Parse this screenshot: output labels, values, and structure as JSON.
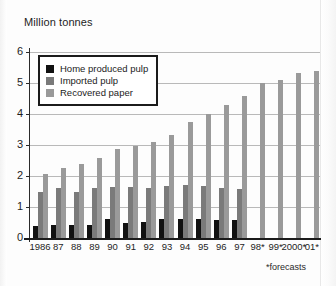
{
  "chart_data": {
    "type": "bar",
    "title": "Million tonnes",
    "xlabel": "",
    "ylabel": "Million tonnes",
    "ylim": [
      0,
      6
    ],
    "yticks": [
      0,
      1,
      2,
      3,
      4,
      5,
      6
    ],
    "grid": true,
    "legend_position": "top-left",
    "footnote": "*forecasts",
    "categories": [
      "1986",
      "87",
      "88",
      "89",
      "90",
      "91",
      "92",
      "93",
      "94",
      "95",
      "96",
      "97",
      "98*",
      "99*",
      "2000*",
      "01*"
    ],
    "series": [
      {
        "name": "Home produced pulp",
        "color": "#111111",
        "values": [
          0.4,
          0.42,
          0.42,
          0.42,
          0.62,
          0.5,
          0.52,
          0.62,
          0.6,
          0.6,
          0.58,
          0.58,
          null,
          null,
          null,
          null
        ]
      },
      {
        "name": "Imported pulp",
        "color": "#7a7a7a",
        "values": [
          1.5,
          1.6,
          1.48,
          1.62,
          1.64,
          1.64,
          1.62,
          1.67,
          1.7,
          1.67,
          1.6,
          1.58,
          null,
          null,
          null,
          null
        ]
      },
      {
        "name": "Recovered paper",
        "color": "#9a9a9a",
        "values": [
          2.08,
          2.27,
          2.39,
          2.57,
          2.88,
          2.97,
          3.09,
          3.32,
          3.74,
          4.0,
          4.28,
          4.58,
          5.0,
          5.11,
          5.31,
          5.4
        ]
      }
    ]
  },
  "legend": {
    "items": [
      {
        "label": "Home produced pulp"
      },
      {
        "label": "Imported pulp"
      },
      {
        "label": "Recovered paper"
      }
    ]
  }
}
